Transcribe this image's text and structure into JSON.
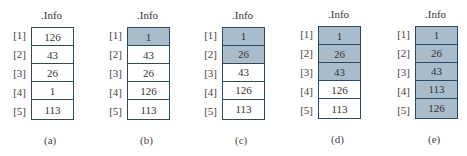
{
  "figure": {
    "field_label": ".Info",
    "colors": {
      "shaded": "#a9bccb",
      "border": "#2c4a63",
      "unshaded": "#ffffff"
    },
    "indices": [
      "[1]",
      "[2]",
      "[3]",
      "[4]",
      "[5]"
    ],
    "panels": [
      {
        "caption": "(a)",
        "values": [
          "126",
          "43",
          "26",
          "1",
          "113"
        ],
        "shaded": [
          false,
          false,
          false,
          false,
          false
        ]
      },
      {
        "caption": "(b)",
        "values": [
          "1",
          "43",
          "26",
          "126",
          "113"
        ],
        "shaded": [
          true,
          false,
          false,
          false,
          false
        ]
      },
      {
        "caption": "(c)",
        "values": [
          "1",
          "26",
          "43",
          "126",
          "113"
        ],
        "shaded": [
          true,
          true,
          false,
          false,
          false
        ]
      },
      {
        "caption": "(d)",
        "values": [
          "1",
          "26",
          "43",
          "126",
          "113"
        ],
        "shaded": [
          true,
          true,
          true,
          false,
          false
        ]
      },
      {
        "caption": "(e)",
        "values": [
          "1",
          "26",
          "43",
          "113",
          "126"
        ],
        "shaded": [
          true,
          true,
          true,
          true,
          true
        ]
      }
    ]
  }
}
